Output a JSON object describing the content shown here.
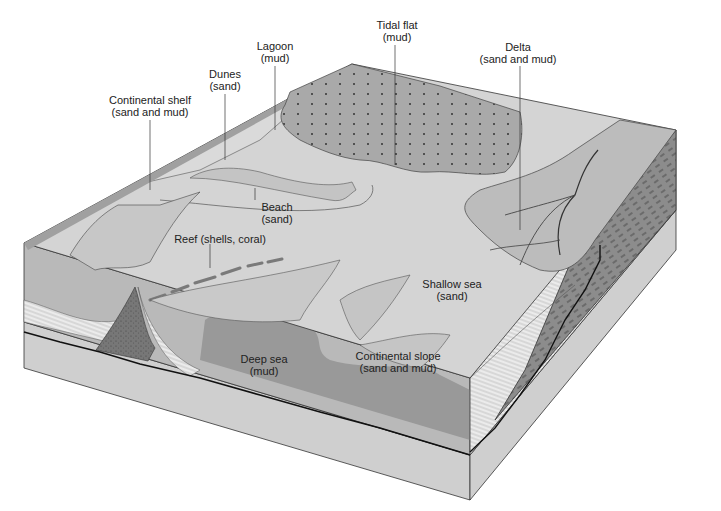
{
  "diagram": {
    "colors": {
      "shelf_surface": "#d6d6d6",
      "land_surface": "#c9c9c9",
      "tidal_flat": "#a8a8a8",
      "lagoon_light": "#e0e0e0",
      "deep_sea": "#9a9a9a",
      "water_front": "#b8b8b8",
      "right_face": "#8a8a8a",
      "base_rock": "#cfcfcf",
      "outline": "#333333"
    },
    "labels": [
      {
        "id": "continental-shelf",
        "line1": "Continental shelf",
        "line2": "(sand and mud)"
      },
      {
        "id": "dunes",
        "line1": "Dunes",
        "line2": "(sand)"
      },
      {
        "id": "lagoon",
        "line1": "Lagoon",
        "line2": "(mud)"
      },
      {
        "id": "tidal-flat",
        "line1": "Tidal flat",
        "line2": "(mud)"
      },
      {
        "id": "delta",
        "line1": "Delta",
        "line2": "(sand and mud)"
      },
      {
        "id": "beach",
        "line1": "Beach",
        "line2": "(sand)"
      },
      {
        "id": "reef",
        "line1": "Reef (shells, coral)",
        "line2": ""
      },
      {
        "id": "shallow-sea",
        "line1": "Shallow sea",
        "line2": "(sand)"
      },
      {
        "id": "deep-sea",
        "line1": "Deep sea",
        "line2": "(mud)"
      },
      {
        "id": "continental-slope",
        "line1": "Continental slope",
        "line2": "(sand and mud)"
      }
    ]
  }
}
